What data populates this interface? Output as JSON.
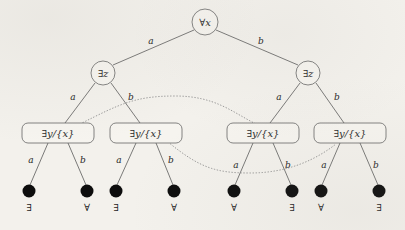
{
  "figure": {
    "background_color": "#f3f1ec",
    "line_color": "#5a5a5a",
    "arc_color": "#8f8f8f",
    "leaf_color": "#0d0d0d"
  },
  "tree": {
    "root": {
      "id": "root",
      "label": "∀x",
      "shape": "circle",
      "x": 205,
      "y": 22,
      "r": 13
    },
    "level2": [
      {
        "id": "n-l",
        "label": "∃z",
        "shape": "circle",
        "x": 103,
        "y": 73,
        "r": 12
      },
      {
        "id": "n-r",
        "label": "∃z",
        "shape": "circle",
        "x": 308,
        "y": 73,
        "r": 12
      }
    ],
    "level3": [
      {
        "id": "b1",
        "label": "∃y/{x}",
        "shape": "rounded-rect",
        "x": 58,
        "y": 133
      },
      {
        "id": "b2",
        "label": "∃y/{x}",
        "shape": "rounded-rect",
        "x": 146,
        "y": 133
      },
      {
        "id": "b3",
        "label": "∃y/{x}",
        "shape": "rounded-rect",
        "x": 263,
        "y": 133
      },
      {
        "id": "b4",
        "label": "∃y/{x}",
        "shape": "rounded-rect",
        "x": 350,
        "y": 133
      }
    ],
    "leaves": [
      {
        "id": "lf1",
        "label": "∃",
        "x": 29,
        "y": 192
      },
      {
        "id": "lf2",
        "label": "∀",
        "x": 87,
        "y": 192
      },
      {
        "id": "lf3",
        "label": "∃",
        "x": 116,
        "y": 192
      },
      {
        "id": "lf4",
        "label": "∀",
        "x": 174,
        "y": 192
      },
      {
        "id": "lf5",
        "label": "∀",
        "x": 234,
        "y": 192
      },
      {
        "id": "lf6",
        "label": "∃",
        "x": 292,
        "y": 192
      },
      {
        "id": "lf7",
        "label": "∀",
        "x": 321,
        "y": 192
      },
      {
        "id": "lf8",
        "label": "∃",
        "x": 379,
        "y": 192
      }
    ],
    "edges": [
      {
        "from": "root",
        "to": "n-l",
        "label": "a",
        "lx": 151,
        "ly": 44
      },
      {
        "from": "root",
        "to": "n-r",
        "label": "b",
        "lx": 261,
        "ly": 44
      },
      {
        "from": "n-l",
        "to": "b1",
        "label": "a",
        "lx": 73,
        "ly": 100
      },
      {
        "from": "n-l",
        "to": "b2",
        "label": "b",
        "lx": 131,
        "ly": 100
      },
      {
        "from": "n-r",
        "to": "b3",
        "label": "a",
        "lx": 279,
        "ly": 100
      },
      {
        "from": "n-r",
        "to": "b4",
        "label": "b",
        "lx": 337,
        "ly": 100
      },
      {
        "from": "b1",
        "to": "lf1",
        "label": "a",
        "lx": 31,
        "ly": 160
      },
      {
        "from": "b1",
        "to": "lf2",
        "label": "b",
        "lx": 83,
        "ly": 160
      },
      {
        "from": "b2",
        "to": "lf3",
        "label": "a",
        "lx": 119,
        "ly": 160
      },
      {
        "from": "b2",
        "to": "lf4",
        "label": "b",
        "lx": 171,
        "ly": 160
      },
      {
        "from": "b3",
        "to": "lf5",
        "label": "a",
        "lx": 236,
        "ly": 166
      },
      {
        "from": "b3",
        "to": "lf6",
        "label": "b",
        "lx": 288,
        "ly": 166
      },
      {
        "from": "b4",
        "to": "lf7",
        "label": "a",
        "lx": 324,
        "ly": 166
      },
      {
        "from": "b4",
        "to": "lf8",
        "label": "b",
        "lx": 376,
        "ly": 166
      }
    ],
    "link_arcs": [
      {
        "id": "arc-upper",
        "from": "b1",
        "to": "b3",
        "style": "dotted"
      },
      {
        "id": "arc-lower",
        "from": "b2",
        "to": "b4",
        "style": "dotted"
      }
    ]
  }
}
